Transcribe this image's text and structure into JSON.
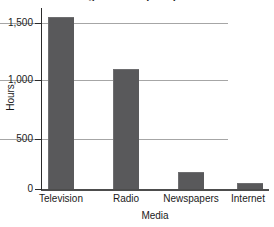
{
  "chart_data": {
    "type": "bar",
    "title": "Average Hours Spent per Year",
    "xlabel": "Media",
    "ylabel": "Hours",
    "categories": [
      "Television",
      "Radio",
      "Newspapers",
      "Internet"
    ],
    "values": [
      1555,
      1080,
      155,
      50
    ],
    "ylim": [
      0,
      1700
    ],
    "yticks": [
      0,
      500,
      1000,
      1500
    ],
    "ytick_labels": [
      "0",
      "500",
      "1,000",
      "1,500"
    ],
    "grid": true,
    "legend": "none",
    "series_color": "#59595b",
    "gridline_color": "#a6a6a6",
    "axis_color": "#2b2b2b",
    "background_color": "#ffffff"
  }
}
